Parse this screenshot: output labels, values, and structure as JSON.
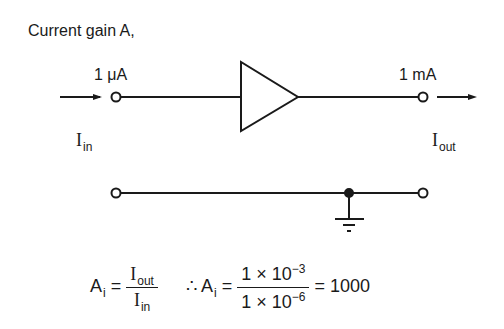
{
  "title": "Current gain A,",
  "circuit": {
    "input_current": "1 μA",
    "output_current": "1 mA",
    "input_label": "I",
    "input_label_sub": "in",
    "output_label": "I",
    "output_label_sub": "out",
    "element": "amplifier-triangle",
    "ground": "ground-symbol"
  },
  "formula": {
    "lhs": "A",
    "lhs_sub": "i",
    "eq": "=",
    "num": "I",
    "num_sub": "out",
    "den": "I",
    "den_sub": "in",
    "therefore": "∴",
    "lhs2": "A",
    "lhs2_sub": "i",
    "eq2": "=",
    "num2": "1 × 10",
    "num2_exp": "−3",
    "den2": "1 × 10",
    "den2_exp": "−6",
    "eq3": "=",
    "result": "1000"
  }
}
